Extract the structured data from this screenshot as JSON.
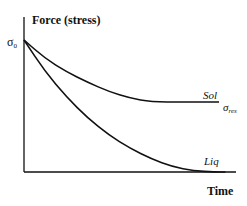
{
  "chart_data": {
    "type": "line",
    "title": "",
    "ylabel": "Force (stress)",
    "xlabel": "Time",
    "y_tick_label": "σ",
    "y_tick_sub": "0",
    "y_start_value_label": "σ0",
    "ylim": [
      0,
      1
    ],
    "xlim": [
      0,
      1
    ],
    "series": [
      {
        "name": "Sol",
        "asymptote_label": "σ",
        "asymptote_sub": "res",
        "start": 1.0,
        "plateau": 0.53,
        "x_plateau": 0.6,
        "points": [
          [
            0,
            1.0
          ],
          [
            0.1,
            0.86
          ],
          [
            0.2,
            0.76
          ],
          [
            0.3,
            0.68
          ],
          [
            0.4,
            0.61
          ],
          [
            0.5,
            0.56
          ],
          [
            0.6,
            0.53
          ],
          [
            0.75,
            0.53
          ],
          [
            0.92,
            0.53
          ]
        ]
      },
      {
        "name": "Liq",
        "start": 1.0,
        "plateau": 0.0,
        "x_plateau": 0.85,
        "points": [
          [
            0,
            1.0
          ],
          [
            0.1,
            0.76
          ],
          [
            0.2,
            0.57
          ],
          [
            0.3,
            0.41
          ],
          [
            0.4,
            0.28
          ],
          [
            0.5,
            0.18
          ],
          [
            0.6,
            0.1
          ],
          [
            0.7,
            0.04
          ],
          [
            0.8,
            0.01
          ],
          [
            0.9,
            0.0
          ],
          [
            0.95,
            0.0
          ]
        ]
      }
    ]
  }
}
